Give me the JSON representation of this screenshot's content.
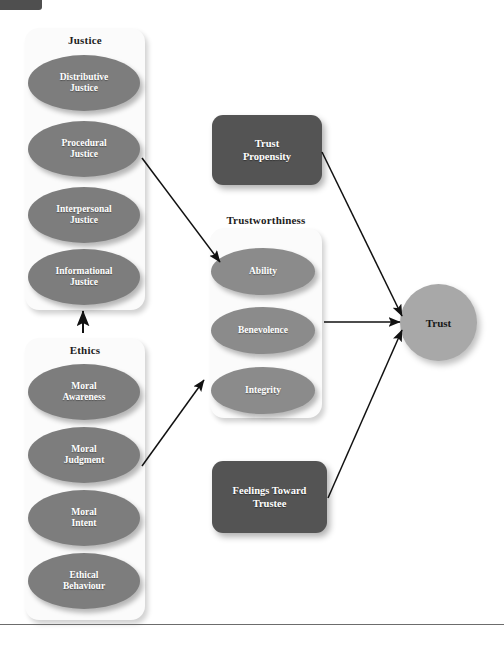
{
  "figure": {
    "background_color": "#ffffff",
    "node_color": "#7d7d7d",
    "dark_node_color": "#545454",
    "outcome_color": "#a8a8a8",
    "card_color": "#fbfbfb",
    "arrow_color": "#111111"
  },
  "groups": {
    "justice": {
      "title": "Justice",
      "nodes": [
        {
          "label": "Distributive\nJustice"
        },
        {
          "label": "Procedural\nJustice"
        },
        {
          "label": "Interpersonal\nJustice"
        },
        {
          "label": "Informational\nJustice"
        }
      ]
    },
    "ethics": {
      "title": "Ethics",
      "nodes": [
        {
          "label": "Moral\nAwareness"
        },
        {
          "label": "Moral\nJudgment"
        },
        {
          "label": "Moral\nIntent"
        },
        {
          "label": "Ethical\nBehaviour"
        }
      ]
    },
    "trustworthiness": {
      "title": "Trustworthiness",
      "nodes": [
        {
          "label": "Ability"
        },
        {
          "label": "Benevolence"
        },
        {
          "label": "Integrity"
        }
      ]
    }
  },
  "standalone": {
    "trust_propensity": "Trust\nPropensity",
    "feelings_toward_trustee": "Feelings Toward\nTrustee",
    "trust": "Trust"
  },
  "arrows": [
    {
      "name": "justice-to-ability",
      "from": "Justice",
      "to": "Ability"
    },
    {
      "name": "ethics-to-justice",
      "from": "Ethics",
      "to": "Justice"
    },
    {
      "name": "ethics-to-trustworthiness",
      "from": "Ethics",
      "to": "Trustworthiness"
    },
    {
      "name": "trust-propensity-to-trust",
      "from": "Trust Propensity",
      "to": "Trust"
    },
    {
      "name": "trustworthiness-to-trust",
      "from": "Trustworthiness",
      "to": "Trust"
    },
    {
      "name": "feelings-toward-trustee-to-trust",
      "from": "Feelings Toward Trustee",
      "to": "Trust"
    }
  ]
}
